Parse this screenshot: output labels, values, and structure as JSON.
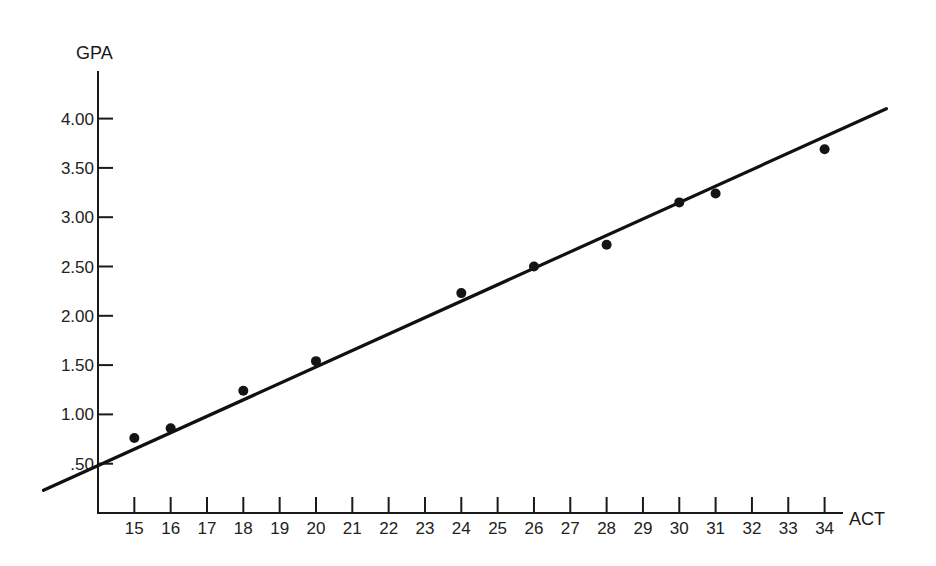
{
  "chart_data": {
    "type": "scatter",
    "title": "",
    "xlabel": "ACT",
    "ylabel": "GPA",
    "xlim": [
      14,
      34.3
    ],
    "ylim": [
      0,
      4.35
    ],
    "grid": false,
    "legend": "none",
    "x_ticks": [
      15,
      16,
      17,
      18,
      19,
      20,
      21,
      22,
      23,
      24,
      25,
      26,
      27,
      28,
      29,
      30,
      31,
      32,
      33,
      34
    ],
    "x_tick_labels": [
      "15",
      "16",
      "17",
      "18",
      "19",
      "20",
      "21",
      "22",
      "23",
      "24",
      "25",
      "26",
      "27",
      "28",
      "29",
      "30",
      "31",
      "32",
      "33",
      "34"
    ],
    "y_ticks": [
      0.5,
      1.0,
      1.5,
      2.0,
      2.5,
      3.0,
      3.5,
      4.0
    ],
    "y_tick_labels": [
      ".50",
      "1.00",
      "1.50",
      "2.00",
      "2.50",
      "3.00",
      "3.50",
      "4.00"
    ],
    "series": [
      {
        "name": "observed",
        "kind": "points",
        "x": [
          15,
          16,
          18,
          20,
          24,
          26,
          28,
          30,
          31,
          34
        ],
        "y": [
          0.76,
          0.86,
          1.24,
          1.54,
          2.23,
          2.5,
          2.72,
          3.15,
          3.24,
          3.69
        ]
      },
      {
        "name": "regression line",
        "kind": "line",
        "x": [
          12.5,
          35.7
        ],
        "y": [
          0.23,
          4.1
        ],
        "intercept_at_act_15": 0.65,
        "slope": 0.1666
      }
    ],
    "colors": {
      "ink": "#141414",
      "background": "#ffffff"
    }
  }
}
